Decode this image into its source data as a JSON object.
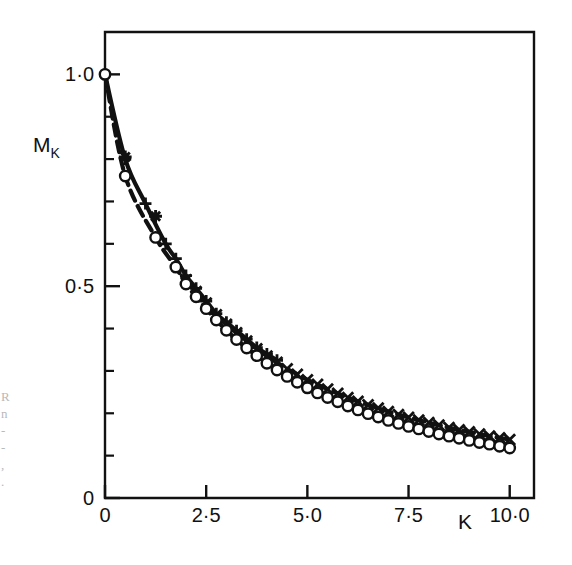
{
  "figure": {
    "background": "#ffffff",
    "ink": "#111111",
    "frame": {
      "left": 105,
      "right": 534,
      "top": 32,
      "bottom": 498
    }
  },
  "axes": {
    "y_title": "M",
    "y_title_sub": "K",
    "x_title": "K",
    "y_ticklabels": [
      "1·0",
      "0·5",
      "0"
    ],
    "x_ticklabels": [
      "0",
      "2·5",
      "5·0",
      "7·5",
      "10·0"
    ]
  },
  "edge_artifacts": [
    "R",
    "n",
    "-",
    "-",
    ",",
    "."
  ],
  "chart_data": {
    "type": "line",
    "title": "",
    "xlabel": "K",
    "ylabel": "M_K",
    "xlim": [
      0,
      10.6
    ],
    "ylim": [
      0,
      1.1
    ],
    "xticks": [
      0,
      2.5,
      5.0,
      7.5,
      10.0
    ],
    "xtick_labels": [
      "0",
      "2·5",
      "5·0",
      "7·5",
      "10·0"
    ],
    "yticks": [
      0,
      0.5,
      1.0
    ],
    "ytick_labels": [
      "0",
      "0·5",
      "1·0"
    ],
    "yminorticks": [
      0.1,
      0.2,
      0.3,
      0.4,
      0.6,
      0.7,
      0.8,
      0.9
    ],
    "grid": false,
    "legend": "none",
    "series": [
      {
        "name": "upper-plus",
        "marker": "plus",
        "linestyle": "solid-thick",
        "x": [
          0.0,
          0.5,
          1.0,
          1.5,
          1.75,
          2.0,
          2.25,
          2.5,
          2.75,
          3.0,
          3.25,
          3.5,
          3.75,
          4.0,
          4.25
        ],
        "y": [
          1.0,
          0.8,
          0.695,
          0.6,
          0.565,
          0.525,
          0.495,
          0.465,
          0.435,
          0.415,
          0.395,
          0.375,
          0.355,
          0.34,
          0.325
        ]
      },
      {
        "name": "upper-cross",
        "marker": "cross",
        "linestyle": "dashed-thick",
        "x": [
          2.0,
          2.25,
          2.5,
          2.75,
          3.0,
          3.25,
          3.5,
          3.75,
          4.0,
          4.25,
          4.5,
          4.75,
          5.0,
          5.25,
          5.5,
          5.75,
          6.0,
          6.25,
          6.5,
          6.75,
          7.0,
          7.25,
          7.5,
          7.75,
          8.0,
          8.25,
          8.5,
          8.75,
          9.0,
          9.25,
          9.5,
          9.75,
          10.0
        ],
        "y": [
          0.515,
          0.487,
          0.46,
          0.432,
          0.41,
          0.39,
          0.37,
          0.352,
          0.335,
          0.32,
          0.305,
          0.292,
          0.279,
          0.268,
          0.257,
          0.247,
          0.237,
          0.228,
          0.22,
          0.212,
          0.204,
          0.197,
          0.19,
          0.184,
          0.178,
          0.172,
          0.166,
          0.161,
          0.156,
          0.151,
          0.146,
          0.142,
          0.138
        ]
      },
      {
        "name": "upper-asterisk",
        "marker": "asterisk",
        "linestyle": "none",
        "x": [
          0.5,
          1.25
        ],
        "y": [
          0.805,
          0.665
        ]
      },
      {
        "name": "lower-circle",
        "marker": "circle",
        "linestyle": "dashed-thick",
        "x": [
          0.0,
          0.5,
          1.25,
          1.75,
          2.0,
          2.25,
          2.5,
          2.75,
          3.0,
          3.25,
          3.5,
          3.75,
          4.0,
          4.25,
          4.5,
          4.75,
          5.0,
          5.25,
          5.5,
          5.75,
          6.0,
          6.25,
          6.5,
          6.75,
          7.0,
          7.25,
          7.5,
          7.75,
          8.0,
          8.25,
          8.5,
          8.75,
          9.0,
          9.25,
          9.5,
          9.75,
          10.0
        ],
        "y": [
          1.0,
          0.76,
          0.615,
          0.545,
          0.505,
          0.475,
          0.447,
          0.42,
          0.396,
          0.374,
          0.354,
          0.336,
          0.318,
          0.302,
          0.287,
          0.273,
          0.26,
          0.248,
          0.237,
          0.227,
          0.217,
          0.208,
          0.199,
          0.191,
          0.183,
          0.176,
          0.169,
          0.163,
          0.157,
          0.151,
          0.146,
          0.141,
          0.136,
          0.131,
          0.127,
          0.122,
          0.118
        ]
      }
    ]
  }
}
